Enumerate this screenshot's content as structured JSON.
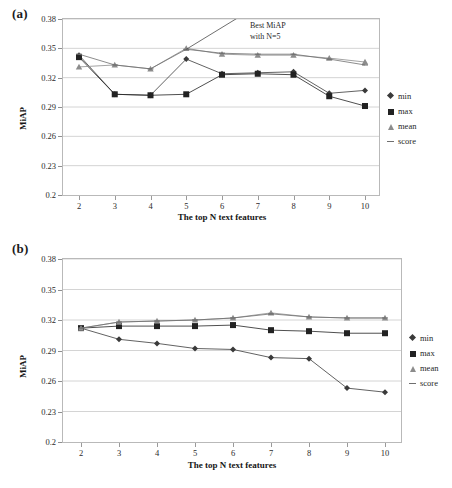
{
  "figure": {
    "panels": [
      {
        "id": "a",
        "label": "(a)",
        "annotation_line1": "Best MiAP",
        "annotation_line2": "with N=5"
      },
      {
        "id": "b",
        "label": "(b)"
      }
    ],
    "legend_title": "",
    "axis": {
      "ylabel": "MiAP",
      "xlabel": "The top N text features",
      "yticks": [
        "0.2",
        "0.23",
        "0.26",
        "0.29",
        "0.32",
        "0.35",
        "0.38"
      ],
      "xticks": [
        "2",
        "3",
        "4",
        "5",
        "6",
        "7",
        "8",
        "9",
        "10"
      ]
    },
    "legend": [
      {
        "label": "min",
        "marker": "diamond-marker-icon",
        "color": "#3a3a3a"
      },
      {
        "label": "max",
        "marker": "square-marker-icon",
        "color": "#222222"
      },
      {
        "label": "mean",
        "marker": "triangle-marker-icon",
        "color": "#8c8c8c"
      },
      {
        "label": "score",
        "marker": "dash-marker-icon",
        "color": "#6f6f6f"
      }
    ]
  },
  "chart_data": [
    {
      "type": "line",
      "panel": "a",
      "title": "(a)",
      "xlabel": "The top N text features",
      "ylabel": "MiAP",
      "x": [
        2,
        3,
        4,
        5,
        6,
        7,
        8,
        9,
        10
      ],
      "xlim": [
        2,
        10
      ],
      "ylim": [
        0.2,
        0.38
      ],
      "ytick_step": 0.03,
      "grid": true,
      "legend_position": "right",
      "annotations": [
        {
          "text": "Best MiAP with N=5",
          "target_x": 5,
          "target_y": 0.349
        }
      ],
      "series": [
        {
          "name": "min",
          "marker": "diamond",
          "color": "#3a3a3a",
          "values": [
            0.343,
            0.303,
            0.302,
            0.339,
            0.324,
            0.325,
            0.326,
            0.304,
            0.307
          ]
        },
        {
          "name": "max",
          "marker": "square",
          "color": "#222222",
          "values": [
            0.341,
            0.303,
            0.302,
            0.303,
            0.323,
            0.324,
            0.323,
            0.301,
            0.291
          ]
        },
        {
          "name": "mean",
          "marker": "triangle",
          "color": "#8c8c8c",
          "values": [
            0.331,
            0.333,
            0.329,
            0.35,
            0.344,
            0.343,
            0.343,
            0.34,
            0.336
          ]
        },
        {
          "name": "score",
          "marker": "dash",
          "color": "#6f6f6f",
          "values": [
            0.344,
            0.333,
            0.329,
            0.349,
            0.345,
            0.344,
            0.344,
            0.339,
            0.333
          ]
        }
      ]
    },
    {
      "type": "line",
      "panel": "b",
      "title": "(b)",
      "xlabel": "The top N text features",
      "ylabel": "MiAP",
      "x": [
        2,
        3,
        4,
        5,
        6,
        7,
        8,
        9,
        10
      ],
      "xlim": [
        2,
        10
      ],
      "ylim": [
        0.2,
        0.38
      ],
      "ytick_step": 0.03,
      "grid": true,
      "legend_position": "right",
      "annotations": [],
      "series": [
        {
          "name": "min",
          "marker": "diamond",
          "color": "#3a3a3a",
          "values": [
            0.312,
            0.301,
            0.297,
            0.292,
            0.291,
            0.283,
            0.282,
            0.253,
            0.249
          ]
        },
        {
          "name": "max",
          "marker": "square",
          "color": "#222222",
          "values": [
            0.312,
            0.314,
            0.314,
            0.314,
            0.315,
            0.31,
            0.309,
            0.307,
            0.307
          ]
        },
        {
          "name": "mean",
          "marker": "triangle",
          "color": "#8c8c8c",
          "values": [
            0.312,
            0.318,
            0.319,
            0.32,
            0.322,
            0.327,
            0.323,
            0.322,
            0.322
          ]
        },
        {
          "name": "score",
          "marker": "dash",
          "color": "#6f6f6f",
          "values": [
            0.312,
            0.318,
            0.319,
            0.32,
            0.322,
            0.326,
            0.323,
            0.322,
            0.322
          ]
        }
      ]
    }
  ]
}
